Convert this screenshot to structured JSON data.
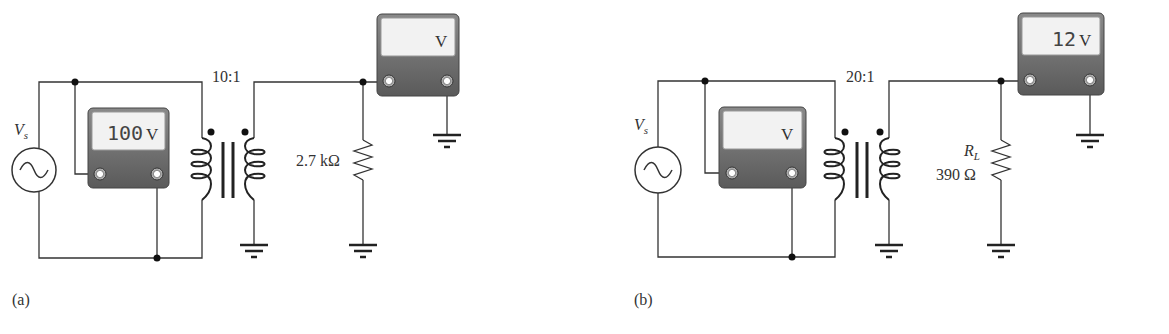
{
  "top_text_cropped": "",
  "circuits": [
    {
      "panel_label": "(a)",
      "source_label": "V",
      "source_subscript": "s",
      "turns_ratio": "10:1",
      "resistor_name": "",
      "resistor_subscript": "",
      "resistor_value": "2.7 kΩ",
      "primary_meter": {
        "reading": "100",
        "unit": "V"
      },
      "secondary_meter": {
        "reading": "",
        "unit": "V"
      }
    },
    {
      "panel_label": "(b)",
      "source_label": "V",
      "source_subscript": "s",
      "turns_ratio": "20:1",
      "resistor_name": "R",
      "resistor_subscript": "L",
      "resistor_value": "390 Ω",
      "primary_meter": {
        "reading": "",
        "unit": "V"
      },
      "secondary_meter": {
        "reading": "12",
        "unit": "V"
      }
    }
  ],
  "colors": {
    "wire": "#333333",
    "meter_body": "#6e6e6e",
    "meter_display": "#f2f2f2",
    "text": "#333333"
  }
}
